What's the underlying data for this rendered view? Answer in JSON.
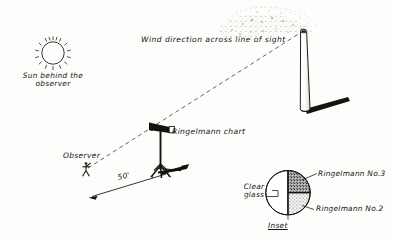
{
  "diagram": {
    "background_color": "#fdfdfb",
    "ink_color": "#15130f",
    "labels": {
      "wind_direction": "Wind direction across line of sight",
      "sun_line1": "Sun behind the",
      "sun_line2": "observer",
      "ringelmann_chart": "Ringelmann chart",
      "observer": "Observer",
      "distance": "50'",
      "clear_glass_line1": "Clear",
      "clear_glass_line2": "glass",
      "ringelmann_no3": "Ringelmann No.3",
      "ringelmann_no2": "Ringelmann No.2",
      "inset": "Inset"
    },
    "elements": {
      "sun": "sun-icon",
      "chimney": "smokestack",
      "smoke_plume": "smoke-plume",
      "observer_figure": "observer-stick-figure",
      "tripod": "ringelmann-chart-tripod",
      "wind_arrow": "wind-direction-arrow",
      "sight_line": "dashed-line-of-sight",
      "dimension_line": "distance-dimension-line",
      "inset_circle": "ringelmann-inset-circle"
    },
    "inset": {
      "segments": [
        {
          "name": "clear-glass",
          "label": "Clear glass",
          "fill": "#ffffff",
          "position": "left-half"
        },
        {
          "name": "ringelmann-no3",
          "label": "Ringelmann No.3",
          "fill": "#5a5a5a",
          "position": "upper-right-quadrant"
        },
        {
          "name": "ringelmann-no2",
          "label": "Ringelmann No.2",
          "fill": "#9a9a9a",
          "position": "lower-right-quadrant"
        }
      ]
    }
  }
}
